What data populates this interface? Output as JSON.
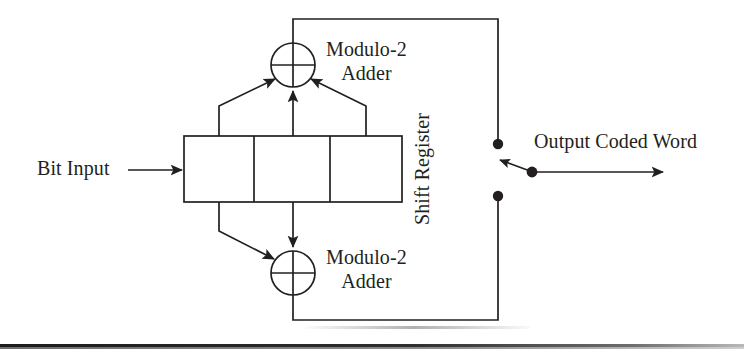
{
  "figure": {
    "kind": "block-diagram",
    "background_color": "#ffffff",
    "line_color": "#231f20"
  },
  "labels": {
    "bit_input": "Bit Input",
    "adder_top_line1": "Modulo-2",
    "adder_top_line2": "Adder",
    "adder_bottom_line1": "Modulo-2",
    "adder_bottom_line2": "Adder",
    "shift_register": "Shift Register",
    "output": "Output Coded Word"
  },
  "shift_register": {
    "cells": 3,
    "x": 184,
    "y": 136,
    "width": 218,
    "height": 66,
    "dividers_x": [
      254,
      330
    ]
  },
  "adders": {
    "top": {
      "cx": 293,
      "cy": 65,
      "r": 22,
      "inputs": 3
    },
    "bottom": {
      "cx": 293,
      "cy": 273,
      "r": 22,
      "inputs": 2
    }
  },
  "switch": {
    "contact_top": {
      "cx": 498,
      "cy": 144,
      "r": 5
    },
    "contact_bottom": {
      "cx": 498,
      "cy": 196,
      "r": 5
    },
    "pivot": {
      "cx": 532,
      "cy": 172,
      "r": 5
    },
    "blade_tip": {
      "x": 497,
      "y": 160
    },
    "position": "upper"
  },
  "feedback": {
    "top_rail_y": 19,
    "bottom_rail_y": 320,
    "rail_right_x": 498
  },
  "output_arrow": {
    "x1": 532,
    "y1": 172,
    "x2": 665,
    "y2": 172
  },
  "input_arrow": {
    "x1": 128,
    "y1": 170,
    "x2": 184,
    "y2": 170
  },
  "tap_points_top": [
    219,
    293,
    366
  ],
  "tap_points_bottom": [
    219,
    293
  ],
  "icons": {
    "xor_circle": "circle-with-cross",
    "arrowhead": "solid-triangle-arrowhead",
    "contact_dot": "filled-circle-terminal"
  }
}
